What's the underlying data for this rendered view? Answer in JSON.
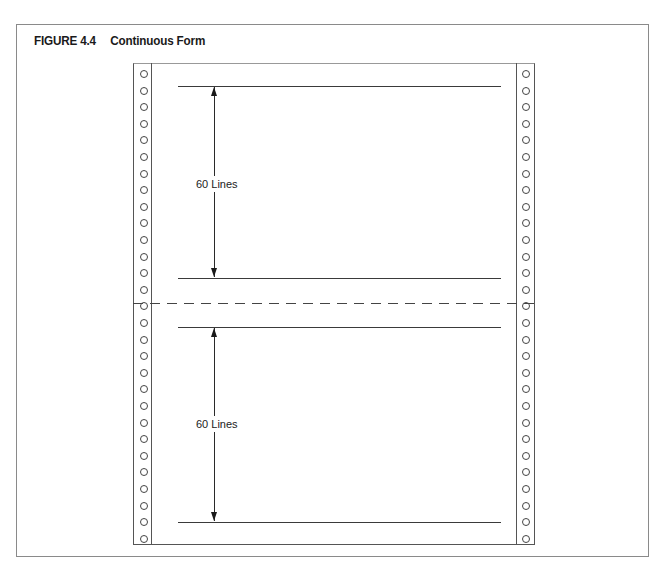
{
  "figure": {
    "number": "FIGURE 4.4",
    "title": "Continuous Form"
  },
  "diagram": {
    "type": "continuous-form-paper",
    "pages": [
      {
        "label": "60 Lines",
        "top_line_y": 86,
        "bottom_line_y": 278
      },
      {
        "label": "60 Lines",
        "top_line_y": 327,
        "bottom_line_y": 522
      }
    ],
    "perforation": {
      "style": "dashed",
      "y": 303
    },
    "sprocket_strips": [
      "left",
      "right"
    ],
    "hole_count_per_strip": 29
  }
}
